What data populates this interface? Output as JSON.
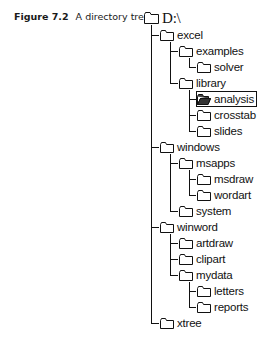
{
  "caption": {
    "number": "Figure 7.2",
    "title": "A directory tree"
  },
  "tree": {
    "root": {
      "label": "D:\\",
      "icon": "folder-closed-icon"
    },
    "nodes": [
      {
        "label": "excel",
        "level": 1,
        "icon": "folder-closed-icon"
      },
      {
        "label": "examples",
        "level": 2,
        "icon": "folder-closed-icon"
      },
      {
        "label": "solver",
        "level": 3,
        "icon": "folder-closed-icon"
      },
      {
        "label": "library",
        "level": 2,
        "icon": "folder-closed-icon"
      },
      {
        "label": "analysis",
        "level": 3,
        "icon": "folder-open-icon",
        "selected": true
      },
      {
        "label": "crosstab",
        "level": 3,
        "icon": "folder-closed-icon"
      },
      {
        "label": "slides",
        "level": 3,
        "icon": "folder-closed-icon"
      },
      {
        "label": "windows",
        "level": 1,
        "icon": "folder-closed-icon"
      },
      {
        "label": "msapps",
        "level": 2,
        "icon": "folder-closed-icon"
      },
      {
        "label": "msdraw",
        "level": 3,
        "icon": "folder-closed-icon"
      },
      {
        "label": "wordart",
        "level": 3,
        "icon": "folder-closed-icon"
      },
      {
        "label": "system",
        "level": 2,
        "icon": "folder-closed-icon"
      },
      {
        "label": "winword",
        "level": 1,
        "icon": "folder-closed-icon"
      },
      {
        "label": "artdraw",
        "level": 2,
        "icon": "folder-closed-icon"
      },
      {
        "label": "clipart",
        "level": 2,
        "icon": "folder-closed-icon"
      },
      {
        "label": "mydata",
        "level": 2,
        "icon": "folder-closed-icon"
      },
      {
        "label": "letters",
        "level": 3,
        "icon": "folder-closed-icon"
      },
      {
        "label": "reports",
        "level": 3,
        "icon": "folder-closed-icon"
      },
      {
        "label": "xtree",
        "level": 1,
        "icon": "folder-closed-icon"
      }
    ]
  }
}
